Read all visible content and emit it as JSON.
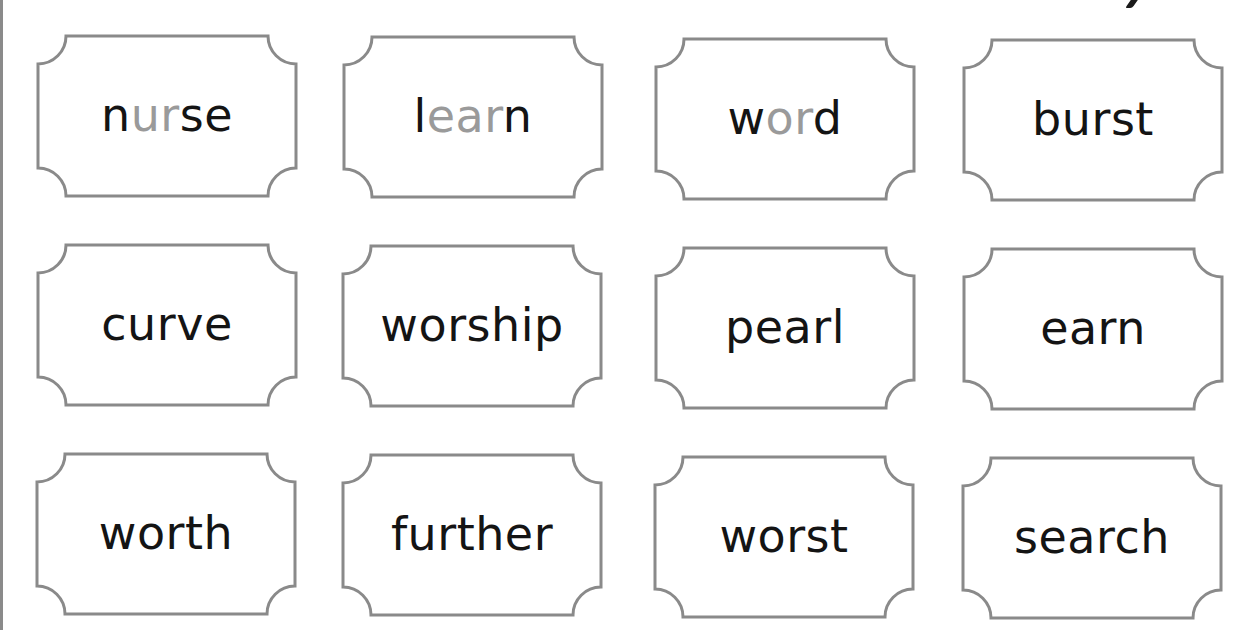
{
  "colors": {
    "text": "#141414",
    "highlight": "#9a9a9a",
    "border": "#8a8a8a"
  },
  "cards": [
    {
      "word": "nurse",
      "parts": [
        {
          "t": "n",
          "hl": false
        },
        {
          "t": "ur",
          "hl": true
        },
        {
          "t": "se",
          "hl": false
        }
      ],
      "x": 34,
      "y": 33
    },
    {
      "word": "learn",
      "parts": [
        {
          "t": "l",
          "hl": false
        },
        {
          "t": "ear",
          "hl": true
        },
        {
          "t": "n",
          "hl": false
        }
      ],
      "x": 340,
      "y": 34
    },
    {
      "word": "word",
      "parts": [
        {
          "t": "w",
          "hl": false
        },
        {
          "t": "or",
          "hl": true
        },
        {
          "t": "d",
          "hl": false
        }
      ],
      "x": 652,
      "y": 36
    },
    {
      "word": "burst",
      "parts": [
        {
          "t": "burst",
          "hl": false
        }
      ],
      "x": 960,
      "y": 37
    },
    {
      "word": "curve",
      "parts": [
        {
          "t": "curve",
          "hl": false
        }
      ],
      "x": 34,
      "y": 242
    },
    {
      "word": "worship",
      "parts": [
        {
          "t": "worship",
          "hl": false
        }
      ],
      "x": 339,
      "y": 243
    },
    {
      "word": "pearl",
      "parts": [
        {
          "t": "pearl",
          "hl": false
        }
      ],
      "x": 652,
      "y": 245
    },
    {
      "word": "earn",
      "parts": [
        {
          "t": "earn",
          "hl": false
        }
      ],
      "x": 960,
      "y": 246
    },
    {
      "word": "worth",
      "parts": [
        {
          "t": "worth",
          "hl": false
        }
      ],
      "x": 33,
      "y": 451
    },
    {
      "word": "further",
      "parts": [
        {
          "t": "further",
          "hl": false
        }
      ],
      "x": 339,
      "y": 452
    },
    {
      "word": "worst",
      "parts": [
        {
          "t": "worst",
          "hl": false
        }
      ],
      "x": 651,
      "y": 454
    },
    {
      "word": "search",
      "parts": [
        {
          "t": "search",
          "hl": false
        }
      ],
      "x": 959,
      "y": 455
    }
  ]
}
